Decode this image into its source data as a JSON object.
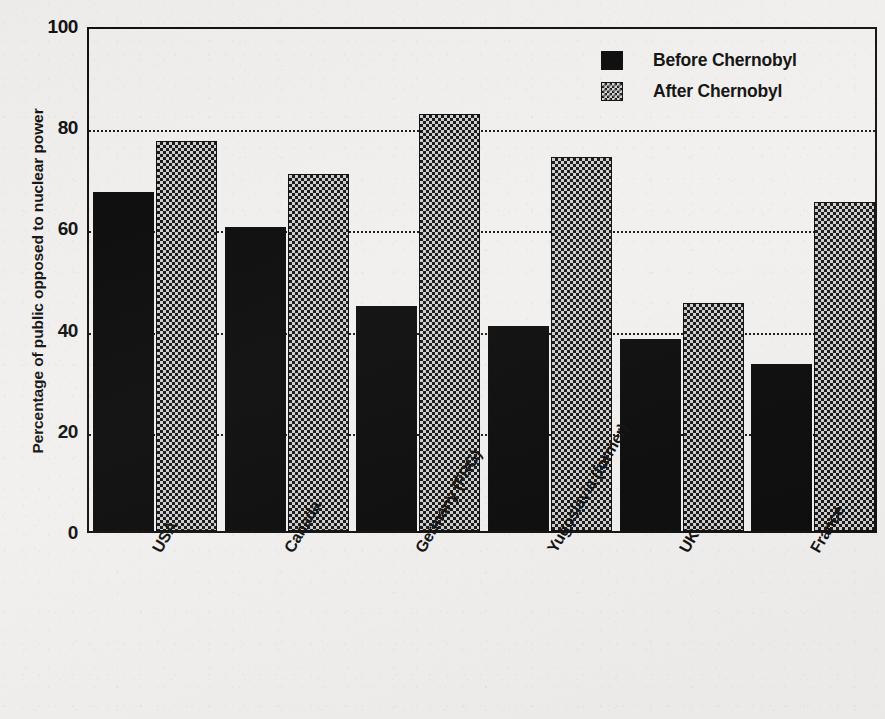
{
  "chart_data": {
    "type": "bar",
    "title": "",
    "subtitle": "",
    "xlabel": "",
    "ylabel": "Percentage of public opposed to nuclear power",
    "ylim": [
      0,
      100
    ],
    "yticks": [
      0,
      20,
      40,
      60,
      80,
      100
    ],
    "grid": "horizontal dotted gridlines at 20, 40, 60, 80",
    "legend_position": "top-right inside plot area",
    "categories": [
      "USA",
      "Canada",
      "Germany (FRG)",
      "Yugoslavia (former)",
      "UK",
      "France"
    ],
    "series": [
      {
        "name": "Before Chernobyl",
        "fill": "solid-black",
        "color": "#0b0b0b",
        "values": [
          67,
          60,
          44.5,
          40.5,
          38,
          33
        ]
      },
      {
        "name": "After Chernobyl",
        "fill": "checkered-grey",
        "color": "#cfcfcf",
        "values": [
          77,
          70.5,
          82.5,
          74,
          45,
          65
        ]
      }
    ]
  },
  "axes": {
    "y_title": "Percentage of public opposed to nuclear power",
    "y_tick_labels": [
      "100",
      "80",
      "60",
      "40",
      "20",
      "0"
    ]
  },
  "legend": {
    "items": [
      {
        "label": "Before Chernobyl",
        "swatch": "solid-black-square"
      },
      {
        "label": "After Chernobyl",
        "swatch": "checkered-square"
      }
    ]
  },
  "colors": {
    "background": "#f2f0ee",
    "ink": "#111111",
    "before_bar": "#0b0b0b",
    "after_bar_base": "#cfcfcf",
    "after_bar_pattern": "#171717"
  }
}
